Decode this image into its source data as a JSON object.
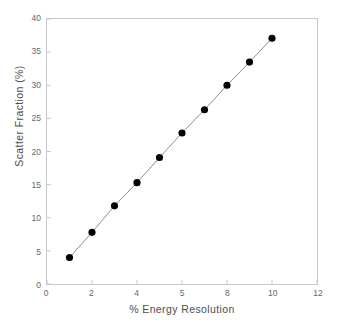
{
  "chart_data": {
    "type": "line",
    "title": "",
    "subtitle": "",
    "xlabel": "% Energy Resolution",
    "ylabel": "Scatter Fraction (%)",
    "xlim": [
      0,
      12
    ],
    "ylim": [
      0,
      40
    ],
    "grid": false,
    "legend": null,
    "marker": "filled-circle",
    "marker_color": "#000000",
    "line_color": "#8c8c8c",
    "axis_color": "#c9c9c9",
    "x_tick_values": [
      0,
      2,
      4,
      6,
      8,
      10,
      12
    ],
    "x_tick_labels": [
      "0",
      "2",
      "4",
      "5",
      "8",
      "10",
      "12"
    ],
    "y_tick_values": [
      0,
      5,
      10,
      15,
      20,
      25,
      30,
      35,
      40
    ],
    "y_tick_labels": [
      "0",
      "5",
      "10",
      "15",
      "20",
      "25",
      "30",
      "35",
      "40"
    ],
    "series": [
      {
        "name": "scatter fraction",
        "x": [
          1,
          2,
          3,
          4,
          5,
          6,
          7,
          8,
          9,
          10
        ],
        "y": [
          4.0,
          7.8,
          11.8,
          15.3,
          19.1,
          22.8,
          26.3,
          30.0,
          33.5,
          37.1
        ]
      }
    ]
  }
}
